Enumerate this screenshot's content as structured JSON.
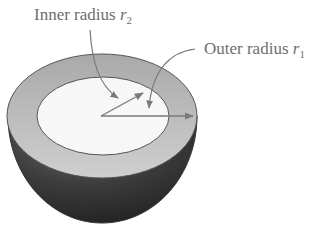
{
  "diagram": {
    "labels": {
      "inner": {
        "text": "Inner radius ",
        "var": "r",
        "sub": "2"
      },
      "outer": {
        "text": "Outer radius ",
        "var": "r",
        "sub": "1"
      }
    },
    "colors": {
      "background": "#ffffff",
      "rim": "#bdbdbd",
      "inner_face": "#f7f7f7",
      "shell_dark": "#3a3a3a",
      "stroke": "#555555",
      "arrow": "#7a7a7a",
      "text": "#6e6e6e"
    }
  }
}
